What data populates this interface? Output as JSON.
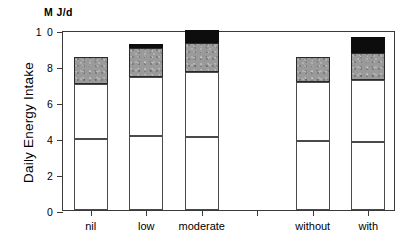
{
  "chart_data": {
    "type": "bar",
    "title": "",
    "subtitle": "",
    "ylabel": "Daily Energy Intake",
    "yunits": "M J/d",
    "xlabel": "",
    "categories": [
      "nil",
      "low",
      "moderate",
      "",
      "without",
      "with"
    ],
    "ytick_labels": [
      "0",
      "2",
      "4",
      "6",
      "8",
      "1 0"
    ],
    "ytick_values": [
      0,
      2,
      4,
      6,
      8,
      10
    ],
    "ylim": [
      0,
      10
    ],
    "grid": false,
    "legend": "none",
    "stacked": true,
    "series": [
      {
        "name": "lower-white",
        "color": "#ffffff",
        "values": [
          3.95,
          4.1,
          4.05,
          null,
          3.85,
          3.8
        ]
      },
      {
        "name": "upper-white",
        "color": "#ffffff",
        "values": [
          3.05,
          3.3,
          3.6,
          null,
          3.25,
          3.45
        ]
      },
      {
        "name": "gray",
        "color": "#9a9a9a",
        "values": [
          1.5,
          1.6,
          1.65,
          null,
          1.4,
          1.5
        ]
      },
      {
        "name": "black",
        "color": "#0d0d0d",
        "values": [
          0.0,
          0.25,
          0.7,
          null,
          0.0,
          0.85
        ]
      }
    ],
    "bar_totals": [
      8.5,
      9.25,
      9.95,
      null,
      8.5,
      9.6
    ]
  },
  "axis": {
    "units_label": "M J/d",
    "y_title": "Daily Energy Intake"
  }
}
